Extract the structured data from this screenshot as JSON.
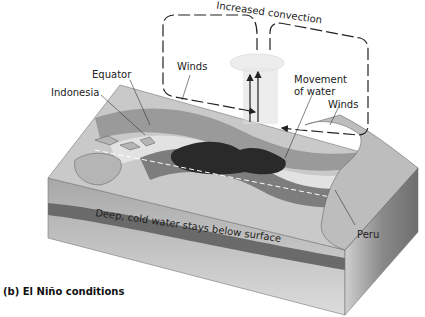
{
  "diagram": {
    "labels": {
      "increased_convection": "Increased convection",
      "winds_left": "Winds",
      "equator": "Equator",
      "indonesia": "Indonesia",
      "movement_of_water_line1": "Movement",
      "movement_of_water_line2": "of water",
      "winds_right": "Winds",
      "deep_cold_water": "Deep, cold water stays below surface",
      "peru": "Peru"
    },
    "caption": "(b) El Niño conditions",
    "colors": {
      "top_face_light": "#c9c9c9",
      "warm_pool_dark": "#2a2a2a",
      "band_mid": "#7d7d7d",
      "front_face": "#b0b0b0",
      "deep_band": "#6a6a6a",
      "side_face": "#8e8e8e",
      "arrow": "#222222"
    }
  }
}
